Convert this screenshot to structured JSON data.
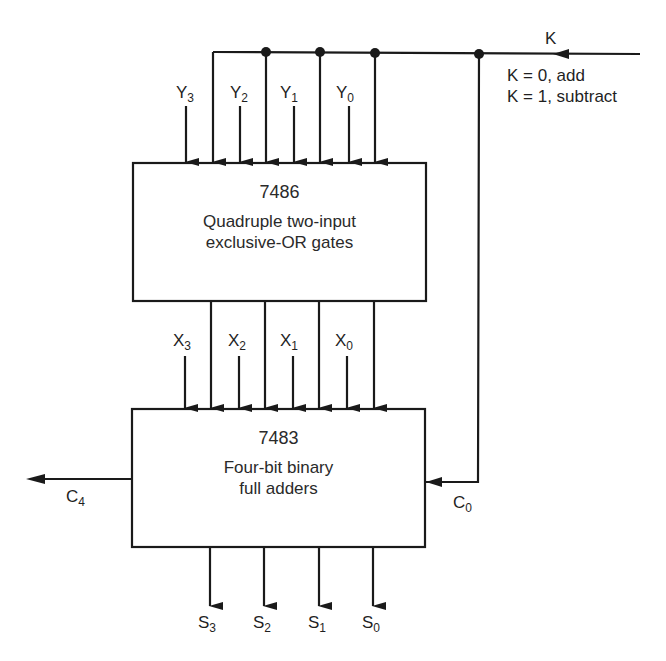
{
  "diagram": {
    "type": "block-diagram",
    "control": {
      "label": "K",
      "notes": [
        "K = 0, add",
        "K = 1, subtract"
      ]
    },
    "xor_block": {
      "part_number": "7486",
      "description_line1": "Quadruple two-input",
      "description_line2": "exclusive-OR gates"
    },
    "adder_block": {
      "part_number": "7483",
      "description_line1": "Four-bit binary",
      "description_line2": "full adders"
    },
    "y_inputs": [
      {
        "base": "Y",
        "sub": "3"
      },
      {
        "base": "Y",
        "sub": "2"
      },
      {
        "base": "Y",
        "sub": "1"
      },
      {
        "base": "Y",
        "sub": "0"
      }
    ],
    "x_inputs": [
      {
        "base": "X",
        "sub": "3"
      },
      {
        "base": "X",
        "sub": "2"
      },
      {
        "base": "X",
        "sub": "1"
      },
      {
        "base": "X",
        "sub": "0"
      }
    ],
    "sum_outputs": [
      {
        "base": "S",
        "sub": "3"
      },
      {
        "base": "S",
        "sub": "2"
      },
      {
        "base": "S",
        "sub": "1"
      },
      {
        "base": "S",
        "sub": "0"
      }
    ],
    "carry_out": {
      "base": "C",
      "sub": "4"
    },
    "carry_in": {
      "base": "C",
      "sub": "0"
    },
    "colors": {
      "line": "#1a1a1a",
      "background": "#ffffff"
    }
  }
}
